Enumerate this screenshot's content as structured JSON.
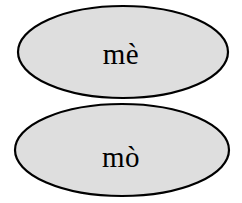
{
  "diagram": {
    "type": "two-set-union-diagram",
    "background_color": "#ffffff",
    "fill_color": "#dedede",
    "stroke_color": "#000000",
    "stroke_width": 2,
    "text_color": "#000000",
    "regions": [
      {
        "id": "upper",
        "label": "mè",
        "shape": "ellipse",
        "cx": 123,
        "cy": 52,
        "rx": 105,
        "ry": 46
      },
      {
        "id": "lower",
        "label": "mò",
        "shape": "ellipse",
        "cx": 122,
        "cy": 150,
        "rx": 107,
        "ry": 46
      }
    ],
    "waist": {
      "left_cusp_x": 78,
      "right_cusp_x": 172,
      "y": 97
    }
  }
}
